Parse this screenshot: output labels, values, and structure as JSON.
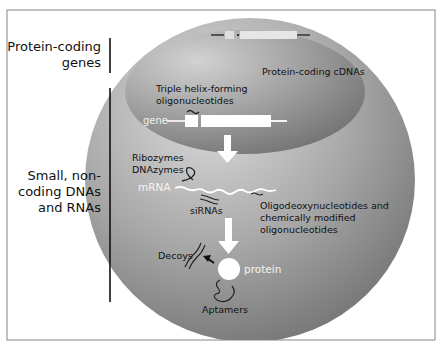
{
  "diagram": {
    "colors": {
      "frame": "#9a9a9a",
      "sphere_light": "#d6d6d6",
      "sphere_dark": "#6e6e6e",
      "nucleus_light": "#c8c8c8",
      "nucleus_dark": "#7a7a7a",
      "molecule": "#ffffff",
      "label": "#111111"
    },
    "side_labels": {
      "protein_coding": {
        "line1": "Protein-coding",
        "line2": "genes"
      },
      "noncoding": {
        "line1": "Small, non-",
        "line2": "coding DNAs",
        "line3": "and RNAs"
      }
    },
    "nucleus": {
      "cdna_label": "Protein-coding cDNAs",
      "triple_helix_label": {
        "line1": "Triple helix-forming",
        "line2": "oligonucleotides"
      },
      "gene_label": "gene"
    },
    "cytoplasm": {
      "ribozymes_label": {
        "line1": "Ribozymes",
        "line2": "DNAzymes"
      },
      "mrna_label": "mRNA",
      "sirnas_label": "siRNAs",
      "odn_label": {
        "line1": "Oligodeoxynucleotides and",
        "line2": "chemically modified",
        "line3": "oligonucleotides"
      },
      "decoys_label": "Decoys",
      "protein_label": "protein",
      "aptamers_label": "Aptamers"
    }
  }
}
